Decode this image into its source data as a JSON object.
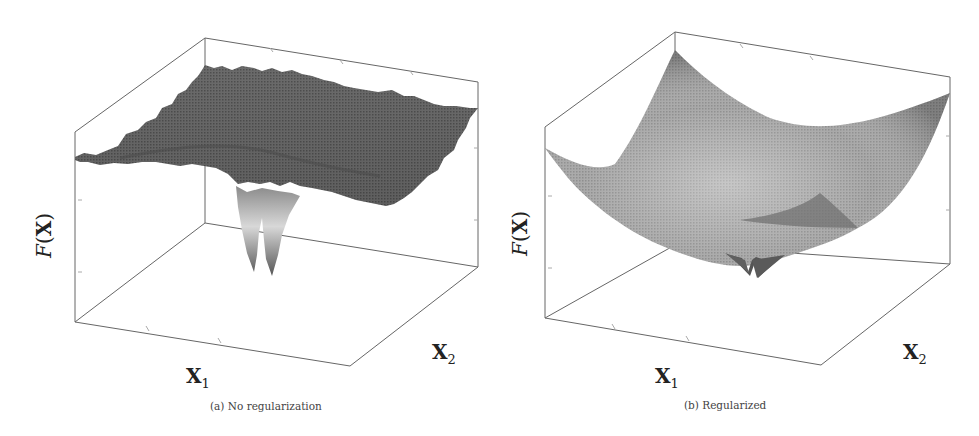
{
  "figure": {
    "panels": [
      {
        "id": "a",
        "caption": "(a) No regularization",
        "y_label_fn": "F",
        "y_label_arg": "X",
        "x1_label": "X",
        "x1_sub": "1",
        "x2_label": "X",
        "x2_sub": "2",
        "surface": "Rugged flat plateau with a deep narrow double-spike well near the center"
      },
      {
        "id": "b",
        "caption": "(b) Regularized",
        "y_label_fn": "F",
        "y_label_arg": "X",
        "x1_label": "X",
        "x1_sub": "1",
        "x2_label": "X",
        "x2_sub": "2",
        "surface": "Smooth convex bowl with a small notched minimum near the center"
      }
    ]
  },
  "colors": {
    "box_line": "#666666",
    "surface_dark": "#5a5a5a",
    "surface_mid": "#8a8a8a",
    "surface_light": "#c8c8c8"
  }
}
